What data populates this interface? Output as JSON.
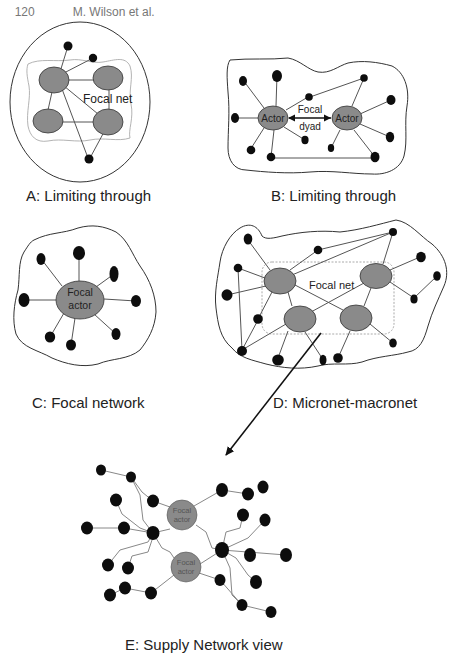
{
  "header": {
    "page_number": "120",
    "running_title": "M. Wilson et al."
  },
  "panels": {
    "A": {
      "caption": "A: Limiting through",
      "inner_label": "Focal net"
    },
    "B": {
      "caption": "B: Limiting through",
      "left_actor": "Actor",
      "right_actor": "Actor",
      "dyad_label_1": "Focal",
      "dyad_label_2": "dyad"
    },
    "C": {
      "caption": "C: Focal network",
      "actor_label_1": "Focal",
      "actor_label_2": "actor"
    },
    "D": {
      "caption": "D: Micronet-macronet",
      "inner_label": "Focal net"
    },
    "E": {
      "caption": "E: Supply Network view",
      "actor_top_1": "Focal",
      "actor_top_2": "actor",
      "actor_bottom_1": "Focal",
      "actor_bottom_2": "actor"
    }
  },
  "colors": {
    "node_dark": "#0d0d0d",
    "node_focal": "#8a8a8a",
    "edge": "#555555",
    "focal_boundary": "#aaaaaa"
  }
}
